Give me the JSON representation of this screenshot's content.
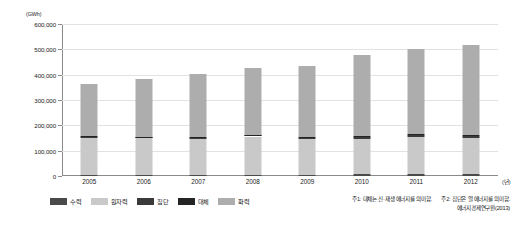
{
  "chart_data": {
    "type": "bar",
    "stacked": true,
    "title": "",
    "xlabel": "(년)",
    "ylabel": "(GWh)",
    "ylim": [
      0,
      600000
    ],
    "ytick_step": 100000,
    "grid": true,
    "legend_position": "bottom-left",
    "categories": [
      "2005",
      "2006",
      "2007",
      "2008",
      "2009",
      "2010",
      "2011",
      "2012"
    ],
    "ytick_labels": [
      "0",
      "100,000",
      "200,000",
      "300,000",
      "400,000",
      "500,000",
      "600,000"
    ],
    "yticks": [
      0,
      100000,
      200000,
      300000,
      400000,
      500000,
      600000
    ],
    "series": [
      {
        "name": "수력",
        "color": "#4a4a4a",
        "values": [
          5200,
          5200,
          5000,
          5400,
          5600,
          6000,
          6500,
          6800
        ]
      },
      {
        "name": "원자력",
        "color": "#c9c9c9",
        "values": [
          146800,
          143800,
          142500,
          150600,
          141400,
          141500,
          147500,
          143200
        ]
      },
      {
        "name": "집단",
        "color": "#3a3a3a",
        "values": [
          4000,
          4000,
          4500,
          5000,
          5000,
          6500,
          8000,
          8500
        ]
      },
      {
        "name": "대체",
        "color": "#242424",
        "values": [
          1500,
          1700,
          1900,
          2200,
          2600,
          3200,
          4000,
          4800
        ]
      },
      {
        "name": "화력",
        "color": "#adadad",
        "values": [
          205500,
          226300,
          248100,
          264800,
          281400,
          321800,
          336000,
          352700
        ]
      }
    ],
    "totals": [
      363000,
      381000,
      402000,
      428000,
      436000,
      479000,
      502000,
      516000
    ],
    "notes": [
      "주1: 대체는 신·재생 에너지를 의미함.",
      "주2: 집단은 열 에너지를 의미함."
    ],
    "source": "에너지경제연구원(2013)"
  }
}
